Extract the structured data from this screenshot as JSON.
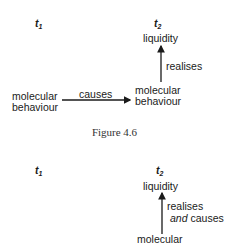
{
  "figure_top": {
    "time_left": {
      "base": "t",
      "sub": "1"
    },
    "time_right": {
      "base": "t",
      "sub": "2"
    },
    "top_node": "liquidity",
    "vertical_relation": "realises",
    "left_node_line1": "molecular",
    "left_node_line2": "behaviour",
    "horizontal_relation": "causes",
    "right_node_line1": "molecular",
    "right_node_line2": "behaviour"
  },
  "caption": "Figure 4.6",
  "figure_bottom": {
    "time_left": {
      "base": "t",
      "sub": "1"
    },
    "time_right": {
      "base": "t",
      "sub": "2"
    },
    "top_node": "liquidity",
    "vertical_relation_line1": "realises",
    "vertical_relation_line2_italic": "and",
    "vertical_relation_line2_rest": " causes",
    "bottom_node_line1": "molecular"
  },
  "colors": {
    "text": "#1a1a1a",
    "background": "#ffffff"
  }
}
